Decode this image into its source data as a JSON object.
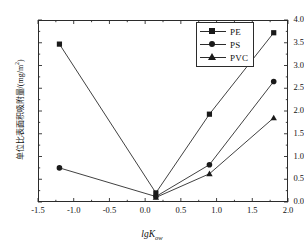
{
  "chart_data": {
    "type": "line",
    "title": "",
    "xlabel": "lgKow",
    "ylabel": "单位比表面积吸附量/(mg/m2)",
    "xlim": [
      -1.5,
      2.0
    ],
    "ylim": [
      0.0,
      4.0
    ],
    "xticks": [
      "-1.5",
      "-1.0",
      "-0.5",
      "0.0",
      "0.5",
      "1.0",
      "1.5",
      "2.0"
    ],
    "xtick_values": [
      -1.5,
      -1.0,
      -0.5,
      0.0,
      0.5,
      1.0,
      1.5,
      2.0
    ],
    "yticks": [
      "0.0",
      "0.5",
      "1.0",
      "1.5",
      "2.0",
      "2.5",
      "3.0",
      "3.5",
      "4.0"
    ],
    "ytick_values": [
      0.0,
      0.5,
      1.0,
      1.5,
      2.0,
      2.5,
      3.0,
      3.5,
      4.0
    ],
    "grid": false,
    "legend_position": "top-right",
    "x": [
      -1.2,
      0.15,
      0.9,
      1.8
    ],
    "series": [
      {
        "name": "PE",
        "marker": "square",
        "values": [
          3.47,
          0.2,
          1.93,
          3.72
        ]
      },
      {
        "name": "PS",
        "marker": "circle",
        "values": [
          0.75,
          0.12,
          0.82,
          2.65
        ]
      },
      {
        "name": "PVC",
        "marker": "triangle",
        "values": [
          null,
          0.1,
          0.62,
          1.85
        ]
      }
    ],
    "line_color": "#2b2b2b",
    "marker_color": "#1a1a1a"
  },
  "axis": {
    "x_title_main": "lgK",
    "x_title_sub": "ow",
    "y_title_main": "单位比表面积吸附量/(mg/m",
    "y_title_sup": "2",
    "y_title_tail": ")"
  },
  "legend": {
    "items": [
      {
        "label": "PE",
        "marker": "square"
      },
      {
        "label": "PS",
        "marker": "circle"
      },
      {
        "label": "PVC",
        "marker": "triangle"
      }
    ]
  }
}
